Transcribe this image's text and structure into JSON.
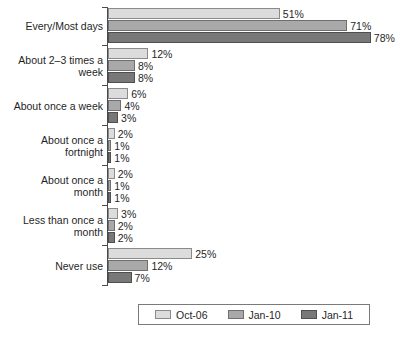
{
  "chart_data": {
    "type": "bar",
    "orientation": "horizontal",
    "title": "",
    "subtitle": "",
    "xlabel": "",
    "ylabel": "",
    "xlim": [
      0,
      80
    ],
    "grid": false,
    "legend_position": "bottom",
    "value_suffix": "%",
    "categories": [
      "Every/Most days",
      "About 2–3 times a\nweek",
      "About once a week",
      "About once a\nfortnight",
      "About once a\nmonth",
      "Less than once a\nmonth",
      "Never use"
    ],
    "series": [
      {
        "name": "Oct-06",
        "color": "#dcdcdc",
        "values": [
          51,
          12,
          6,
          2,
          2,
          3,
          25
        ]
      },
      {
        "name": "Jan-10",
        "color": "#a9a9a9",
        "values": [
          71,
          8,
          4,
          1,
          1,
          2,
          12
        ]
      },
      {
        "name": "Jan-11",
        "color": "#787878",
        "values": [
          78,
          8,
          3,
          1,
          1,
          2,
          7
        ]
      }
    ],
    "data_labels": [
      [
        "51%",
        "71%",
        "78%"
      ],
      [
        "12%",
        "8%",
        "8%"
      ],
      [
        "6%",
        "4%",
        "3%"
      ],
      [
        "2%",
        "1%",
        "1%"
      ],
      [
        "2%",
        "1%",
        "1%"
      ],
      [
        "3%",
        "2%",
        "2%"
      ],
      [
        "25%",
        "12%",
        "7%"
      ]
    ]
  },
  "legend": {
    "items": [
      {
        "label": "Oct-06",
        "swatch": "legend-swatch-oct-06"
      },
      {
        "label": "Jan-10",
        "swatch": "legend-swatch-jan-10"
      },
      {
        "label": "Jan-11",
        "swatch": "legend-swatch-jan-11"
      }
    ]
  }
}
